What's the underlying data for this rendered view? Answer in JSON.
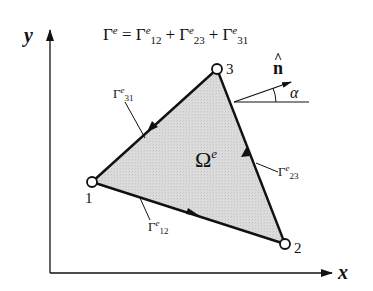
{
  "title_equation": {
    "lhs": "Γ",
    "lhs_sup": "e",
    "eq": " = ",
    "terms": [
      {
        "base": "Γ",
        "sup": "e",
        "sub": "12"
      },
      {
        "base": "Γ",
        "sup": "e",
        "sub": "23"
      },
      {
        "base": "Γ",
        "sup": "e",
        "sub": "31"
      }
    ],
    "plus": "+"
  },
  "axes": {
    "x_label": "x",
    "y_label": "y"
  },
  "element": {
    "domain_label": "Ω",
    "domain_sup": "e",
    "fill_color": "#d9d9d9",
    "nodes": [
      {
        "id": "1",
        "label": "1"
      },
      {
        "id": "2",
        "label": "2"
      },
      {
        "id": "3",
        "label": "3"
      }
    ],
    "edges": [
      {
        "id": "12",
        "base": "Γ",
        "sup": "e",
        "sub": "12"
      },
      {
        "id": "23",
        "base": "Γ",
        "sup": "e",
        "sub": "23"
      },
      {
        "id": "31",
        "base": "Γ",
        "sup": "e",
        "sub": "31"
      }
    ]
  },
  "normal": {
    "label": "n",
    "hat": "^",
    "angle_label": "α"
  }
}
